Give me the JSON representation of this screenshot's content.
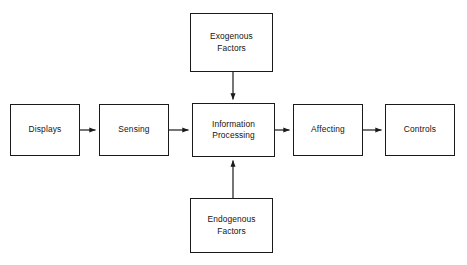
{
  "diagram": {
    "background_color": "#ffffff",
    "stroke_color": "#1a1a1a",
    "text_color": "#141414",
    "nodes": {
      "displays": {
        "label": "Displays",
        "x": 10,
        "y": 104,
        "w": 70,
        "h": 52
      },
      "sensing": {
        "label": "Sensing",
        "x": 99,
        "y": 104,
        "w": 70,
        "h": 52
      },
      "information_processing": {
        "label": "Information\nProcessing",
        "x": 192,
        "y": 103,
        "w": 83,
        "h": 54
      },
      "affecting": {
        "label": "Affecting",
        "x": 293,
        "y": 104,
        "w": 70,
        "h": 52
      },
      "controls": {
        "label": "Controls",
        "x": 385,
        "y": 104,
        "w": 70,
        "h": 52
      },
      "exogenous_factors": {
        "label": "Exogenous\nFactors",
        "x": 190,
        "y": 13,
        "w": 83,
        "h": 59
      },
      "endogenous_factors": {
        "label": "Endogenous\nFactors",
        "x": 190,
        "y": 198,
        "w": 83,
        "h": 55
      }
    },
    "connectors": [
      {
        "name": "displays-to-sensing",
        "from": "displays",
        "to": "sensing",
        "direction": "right",
        "x1": 80,
        "y1": 130,
        "x2": 97,
        "y2": 130
      },
      {
        "name": "sensing-to-information-processing",
        "from": "sensing",
        "to": "information_processing",
        "direction": "right",
        "x1": 169,
        "y1": 130,
        "x2": 190,
        "y2": 130
      },
      {
        "name": "information-processing-to-affecting",
        "from": "information_processing",
        "to": "affecting",
        "direction": "right",
        "x1": 275,
        "y1": 130,
        "x2": 291,
        "y2": 130
      },
      {
        "name": "affecting-to-controls",
        "from": "affecting",
        "to": "controls",
        "direction": "right",
        "x1": 363,
        "y1": 130,
        "x2": 383,
        "y2": 130
      },
      {
        "name": "exogenous-to-information-processing",
        "from": "exogenous_factors",
        "to": "information_processing",
        "direction": "down",
        "x1": 233,
        "y1": 72,
        "x2": 233,
        "y2": 101
      },
      {
        "name": "endogenous-to-information-processing",
        "from": "endogenous_factors",
        "to": "information_processing",
        "direction": "up",
        "x1": 233,
        "y1": 198,
        "x2": 233,
        "y2": 159
      }
    ]
  }
}
